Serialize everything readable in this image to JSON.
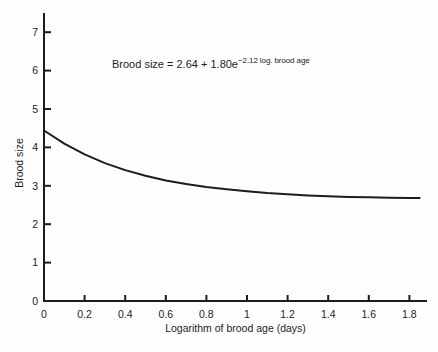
{
  "figure": {
    "background": "#fefefe",
    "ink_color": "#1c1c1c"
  },
  "chart_data": {
    "type": "line",
    "title": "",
    "xlabel": "Logarithm of brood age (days)",
    "ylabel": "Brood size",
    "xlim": [
      0,
      1.88
    ],
    "ylim": [
      0,
      7.5
    ],
    "grid": false,
    "legend": "none",
    "x_tick_labels": [
      "0",
      "0.2",
      "0.4",
      "0.6",
      "0.8",
      "1",
      "1.2",
      "1.4",
      "1.6",
      "1.8"
    ],
    "x_tick_values": [
      0,
      0.2,
      0.4,
      0.6,
      0.8,
      1,
      1.2,
      1.4,
      1.6,
      1.8
    ],
    "y_tick_labels": [
      "0",
      "1",
      "2",
      "3",
      "4",
      "5",
      "6",
      "7"
    ],
    "y_tick_values": [
      0,
      1,
      2,
      3,
      4,
      5,
      6,
      7
    ],
    "equation": {
      "base": "Brood size = 2.64 + 1.80e",
      "superscript": "−2.12 log. brood age"
    },
    "model": {
      "intercept": 2.64,
      "amplitude": 1.8,
      "decay_rate": 2.12
    },
    "line_color": "#1c1c1c",
    "series": [
      {
        "name": "fitted-exponential-curve",
        "x": [
          0,
          0.1,
          0.2,
          0.3,
          0.4,
          0.5,
          0.6,
          0.7,
          0.8,
          0.9,
          1.0,
          1.1,
          1.2,
          1.3,
          1.4,
          1.5,
          1.6,
          1.7,
          1.8,
          1.85
        ],
        "y": [
          4.44,
          4.1,
          3.82,
          3.59,
          3.41,
          3.26,
          3.14,
          3.05,
          2.97,
          2.91,
          2.86,
          2.81,
          2.78,
          2.75,
          2.73,
          2.71,
          2.7,
          2.69,
          2.68,
          2.68
        ]
      }
    ]
  }
}
